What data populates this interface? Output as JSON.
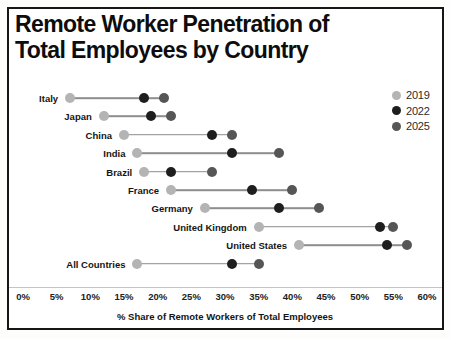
{
  "title": {
    "line1": "Remote Worker Penetration of",
    "line2": "Total Employees by Country"
  },
  "legend": [
    {
      "label": "2019",
      "color": "#b4b4b4"
    },
    {
      "label": "2022",
      "color": "#1e1e1e"
    },
    {
      "label": "2025",
      "color": "#565656"
    }
  ],
  "axis": {
    "label": "% Share of Remote Workers of Total Employees",
    "ticks": [
      "0%",
      "5%",
      "10%",
      "15%",
      "20%",
      "25%",
      "30%",
      "35%",
      "40%",
      "45%",
      "50%",
      "55%",
      "60%"
    ]
  },
  "chart_data": {
    "type": "scatter",
    "subtype": "dumbbell-dot-plot",
    "title": "Remote Worker Penetration of Total Employees by Country",
    "xlabel": "% Share of Remote Workers of Total Employees",
    "xlim": [
      0,
      60
    ],
    "x_tick_step": 5,
    "x_tick_unit": "%",
    "grid": false,
    "legend_position": "top-right",
    "categories": [
      "Italy",
      "Japan",
      "China",
      "India",
      "Brazil",
      "France",
      "Germany",
      "United Kingdom",
      "United States",
      "All Countries"
    ],
    "series": [
      {
        "name": "2019",
        "color": "#b4b4b4",
        "values": [
          7,
          12,
          15,
          17,
          18,
          22,
          27,
          35,
          41,
          17
        ]
      },
      {
        "name": "2022",
        "color": "#1e1e1e",
        "values": [
          18,
          19,
          28,
          31,
          22,
          34,
          38,
          53,
          54,
          31
        ]
      },
      {
        "name": "2025",
        "color": "#565656",
        "values": [
          21,
          22,
          31,
          38,
          28,
          40,
          44,
          55,
          57,
          35
        ]
      }
    ]
  }
}
